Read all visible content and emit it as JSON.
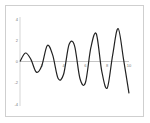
{
  "chart_data": {
    "type": "line",
    "title": "",
    "xlabel": "",
    "ylabel": "",
    "xlim": [
      0,
      10
    ],
    "ylim": [
      -4,
      4
    ],
    "x_ticks": [
      "2",
      "4",
      "6",
      "8",
      "10"
    ],
    "y_ticks": [
      "4",
      "2",
      "0",
      "-2",
      "-4"
    ],
    "grid": false,
    "legend": "none",
    "series": [
      {
        "name": "signal",
        "color": "#222222",
        "x": [
          0,
          0.5,
          1,
          1.5,
          2,
          2.5,
          3,
          3.5,
          4,
          4.5,
          5,
          5.5,
          6,
          6.5,
          7,
          7.5,
          8,
          8.5,
          9,
          9.5,
          10
        ],
        "y": [
          0,
          0.8,
          0.2,
          -1.0,
          -0.4,
          1.5,
          0.6,
          -1.6,
          -1.2,
          1.6,
          1.5,
          -1.6,
          -2.0,
          1.3,
          2.6,
          -0.9,
          -2.5,
          0.6,
          3.1,
          0.2,
          -3.0
        ]
      }
    ]
  }
}
